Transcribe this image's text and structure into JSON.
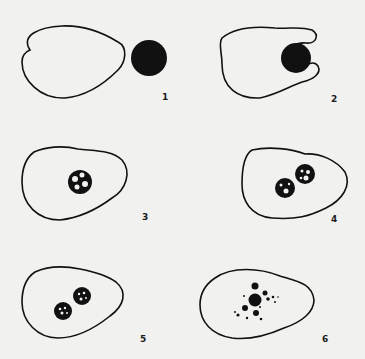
{
  "figure": {
    "colors": {
      "background": "#f1f1ef",
      "ink": "#111111"
    },
    "panels": [
      {
        "label": "1",
        "stage": "particle-approach"
      },
      {
        "label": "2",
        "stage": "pseudopod-engulfing"
      },
      {
        "label": "3",
        "stage": "food-vacuole-formed"
      },
      {
        "label": "4",
        "stage": "vacuole-division"
      },
      {
        "label": "5",
        "stage": "digestion"
      },
      {
        "label": "6",
        "stage": "fragmentation"
      }
    ]
  }
}
